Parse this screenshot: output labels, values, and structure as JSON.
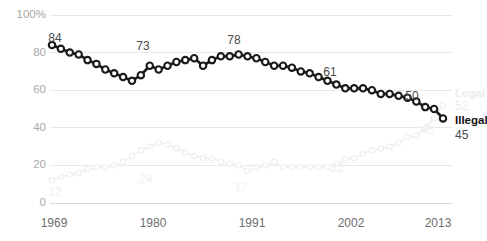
{
  "chart_data": {
    "type": "line",
    "title": "",
    "subtitle": "",
    "xlabel": "",
    "ylabel": "",
    "xlim": [
      1969,
      2013
    ],
    "ylim": [
      0,
      100
    ],
    "grid": true,
    "legend_position": "right-inline",
    "y_ticks": [
      "0",
      "20",
      "40",
      "60",
      "80",
      "100%"
    ],
    "y_tick_values": [
      0,
      20,
      40,
      60,
      80,
      100
    ],
    "x_ticks": [
      "1969",
      "1980",
      "1991",
      "2002",
      "2013"
    ],
    "x_tick_values": [
      1969,
      1980,
      1991,
      2002,
      2013
    ],
    "x": [
      1969,
      1970,
      1971,
      1972,
      1973,
      1974,
      1975,
      1976,
      1977,
      1978,
      1979,
      1980,
      1981,
      1982,
      1983,
      1984,
      1985,
      1986,
      1987,
      1988,
      1989,
      1990,
      1991,
      1992,
      1993,
      1994,
      1995,
      1996,
      1997,
      1998,
      1999,
      2000,
      2001,
      2002,
      2003,
      2004,
      2005,
      2006,
      2007,
      2008,
      2009,
      2010,
      2011,
      2012,
      2013
    ],
    "series": [
      {
        "name": "Illegal",
        "color": "#1b1b1b",
        "emphasis": "primary",
        "end_value": 45,
        "values": [
          84,
          82,
          80,
          79,
          76,
          74,
          71,
          69,
          67,
          65,
          68,
          73,
          71,
          73,
          75,
          76,
          77,
          73,
          76,
          78,
          78,
          79,
          78,
          77,
          75,
          73,
          73,
          72,
          70,
          69,
          67,
          65,
          63,
          61,
          61,
          61,
          60,
          58,
          58,
          57,
          56,
          54,
          51,
          50,
          45
        ]
      },
      {
        "name": "Legal",
        "color": "#f0f0f0",
        "emphasis": "secondary",
        "end_value": 52,
        "values": [
          12,
          14,
          15,
          16,
          18,
          19,
          19,
          20,
          22,
          25,
          28,
          30,
          32,
          31,
          29,
          27,
          25,
          24,
          24,
          22,
          21,
          20,
          17,
          19,
          20,
          22,
          19,
          19,
          19,
          19,
          19,
          19,
          21,
          23,
          24,
          26,
          28,
          29,
          30,
          32,
          35,
          36,
          40,
          45,
          52
        ]
      }
    ],
    "annotations": [
      {
        "series": "Illegal",
        "x": 1969,
        "value": 84,
        "label": "84"
      },
      {
        "series": "Illegal",
        "x": 1980,
        "value": 73,
        "label": "73"
      },
      {
        "series": "Illegal",
        "x": 1989,
        "value": 78,
        "label": "78"
      },
      {
        "series": "Illegal",
        "x": 2002,
        "value": 61,
        "label": "61"
      },
      {
        "series": "Illegal",
        "x": 2012,
        "value": 50,
        "label": "50"
      },
      {
        "series": "Illegal",
        "x": 2013,
        "value": 45,
        "label": "45"
      },
      {
        "series": "Legal",
        "x": 1969,
        "value": 12,
        "label": "12"
      },
      {
        "series": "Legal",
        "x": 1980,
        "value": 24,
        "label": "24"
      },
      {
        "series": "Legal",
        "x": 1991,
        "value": 17,
        "label": "17"
      },
      {
        "series": "Legal",
        "x": 2002,
        "value": 32,
        "label": "32"
      },
      {
        "series": "Legal",
        "x": 2013,
        "value": 45,
        "label": "45"
      }
    ],
    "legend": [
      {
        "name": "Legal",
        "value": "52",
        "color": "#ececec"
      },
      {
        "name": "Illegal",
        "value": "45",
        "color": "#111111"
      }
    ]
  },
  "labels": {
    "y_100": "100%",
    "y_80": "80",
    "y_60": "60",
    "y_40": "40",
    "y_20": "20",
    "y_0": "0",
    "x_1969": "1969",
    "x_1980": "1980",
    "x_1991": "1991",
    "x_2002": "2002",
    "x_2013": "2013",
    "ann_84": "84",
    "ann_73": "73",
    "ann_78": "78",
    "ann_61": "61",
    "ann_50": "50",
    "ann_45_primary": "45",
    "ann_12": "12",
    "ann_24": "24",
    "ann_17": "17",
    "ann_32": "32",
    "ann_45_secondary": "45",
    "legend_legal_name": "Legal",
    "legend_legal_value": "52",
    "legend_illegal_name": "Illegal",
    "legend_illegal_value": "45"
  }
}
